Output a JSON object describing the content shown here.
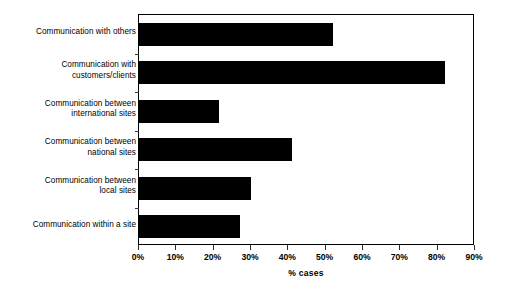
{
  "chart_data": {
    "type": "bar",
    "orientation": "horizontal",
    "title": "",
    "xlabel": "% cases",
    "ylabel": "",
    "xlim": [
      0,
      90
    ],
    "xtick_labels": [
      "0%",
      "10%",
      "20%",
      "30%",
      "40%",
      "50%",
      "60%",
      "70%",
      "80%",
      "90%"
    ],
    "xtick_values": [
      0,
      10,
      20,
      30,
      40,
      50,
      60,
      70,
      80,
      90
    ],
    "grid": false,
    "legend": false,
    "bar_color": "#000000",
    "background_color": "#ffffff",
    "axis_color": "#000000",
    "categories": [
      "Communication with others",
      "Communication with customers/clients",
      "Communication between international sites",
      "Communication between national sites",
      "Communication between local sites",
      "Communication within a site"
    ],
    "category_label_lines": [
      [
        "Communication with others"
      ],
      [
        "Communication with",
        "customers/clients"
      ],
      [
        "Communication between",
        "international sites"
      ],
      [
        "Communication between",
        "national sites"
      ],
      [
        "Communication between",
        "local sites"
      ],
      [
        "Communication within a site"
      ]
    ],
    "values": [
      52,
      82,
      21.5,
      41,
      30,
      27
    ]
  }
}
